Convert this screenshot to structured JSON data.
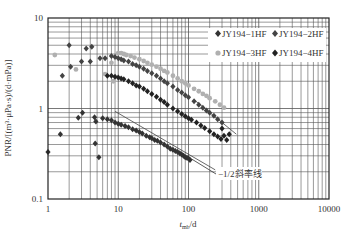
{
  "chart_data": {
    "type": "scatter",
    "title": "",
    "xlabel": "t_mb/d",
    "xlabel_main": "t",
    "xlabel_sub": "mb",
    "xlabel_unit": "/d",
    "ylabel": "PNR/[(m³·μPa·s)/(d·mPa)]",
    "xscale": "log",
    "yscale": "log",
    "xlim": [
      1,
      10000
    ],
    "ylim": [
      0.1,
      10
    ],
    "x_ticks": [
      "1",
      "10",
      "100",
      "1000",
      "10000"
    ],
    "y_ticks": [
      "0.1",
      "1",
      "10"
    ],
    "grid": true,
    "legend_position": "upper right",
    "series": [
      {
        "name": "JY194−1HF",
        "color": "#333333",
        "marker": "diamond",
        "points": [
          [
            1.0,
            0.33
          ],
          [
            1.5,
            0.52
          ],
          [
            2.7,
            0.79
          ],
          [
            3.1,
            0.9
          ],
          [
            4.6,
            0.8
          ],
          [
            4.8,
            0.72
          ],
          [
            4.7,
            0.41
          ],
          [
            5.3,
            0.29
          ],
          [
            6.0,
            0.78
          ],
          [
            7.0,
            0.76
          ],
          [
            8.0,
            0.74
          ],
          [
            9.0,
            0.7
          ],
          [
            10.0,
            0.68
          ],
          [
            11.0,
            0.66
          ],
          [
            12.5,
            0.64
          ],
          [
            14.0,
            0.62
          ],
          [
            16.0,
            0.59
          ],
          [
            18.0,
            0.57
          ],
          [
            20.0,
            0.55
          ],
          [
            22.0,
            0.53
          ],
          [
            25.0,
            0.5
          ],
          [
            28.0,
            0.48
          ],
          [
            30.0,
            0.47
          ],
          [
            33.0,
            0.45
          ],
          [
            36.0,
            0.44
          ],
          [
            40.0,
            0.42
          ],
          [
            45.0,
            0.4
          ],
          [
            50.0,
            0.38
          ],
          [
            55.0,
            0.36
          ],
          [
            60.0,
            0.35
          ],
          [
            65.0,
            0.34
          ],
          [
            70.0,
            0.33
          ],
          [
            75.0,
            0.32
          ],
          [
            80.0,
            0.31
          ],
          [
            85.0,
            0.3
          ],
          [
            90.0,
            0.29
          ],
          [
            95.0,
            0.285
          ],
          [
            100.0,
            0.28
          ],
          [
            105.0,
            0.27
          ]
        ]
      },
      {
        "name": "JY194−2HF",
        "color": "#444444",
        "marker": "diamond",
        "points": [
          [
            1.6,
            2.3
          ],
          [
            2.1,
            2.9
          ],
          [
            2.0,
            5.0
          ],
          [
            3.5,
            4.6
          ],
          [
            4.2,
            4.8
          ],
          [
            3.0,
            3.3
          ],
          [
            4.0,
            3.3
          ],
          [
            5.5,
            3.6
          ],
          [
            6.5,
            3.6
          ],
          [
            8.0,
            3.8
          ],
          [
            9.0,
            3.7
          ],
          [
            10.0,
            3.6
          ],
          [
            11.0,
            3.5
          ],
          [
            12.0,
            3.4
          ],
          [
            14.0,
            3.3
          ],
          [
            16.0,
            3.1
          ],
          [
            18.0,
            3.0
          ],
          [
            20.0,
            2.9
          ],
          [
            23.0,
            2.75
          ],
          [
            26.0,
            2.6
          ],
          [
            30.0,
            2.45
          ],
          [
            35.0,
            2.3
          ],
          [
            40.0,
            2.15
          ],
          [
            45.0,
            2.0
          ],
          [
            50.0,
            1.9
          ],
          [
            60.0,
            1.75
          ],
          [
            70.0,
            1.6
          ],
          [
            80.0,
            1.5
          ],
          [
            90.0,
            1.4
          ],
          [
            100.0,
            1.33
          ],
          [
            120.0,
            1.2
          ],
          [
            140.0,
            1.1
          ],
          [
            160.0,
            1.02
          ],
          [
            180.0,
            0.95
          ],
          [
            200.0,
            0.9
          ],
          [
            230.0,
            0.83
          ],
          [
            260.0,
            0.76
          ],
          [
            300.0,
            0.7
          ]
        ]
      },
      {
        "name": "JY194−3HF",
        "color": "#b0b0b0",
        "marker": "circle",
        "points": [
          [
            1.25,
            3.9
          ],
          [
            2.5,
            2.7
          ],
          [
            6.5,
            2.4
          ],
          [
            8.0,
            3.2
          ],
          [
            8.5,
            2.0
          ],
          [
            10.0,
            4.1
          ],
          [
            11.0,
            4.1
          ],
          [
            12.0,
            4.0
          ],
          [
            13.0,
            3.9
          ],
          [
            15.0,
            3.8
          ],
          [
            17.0,
            3.65
          ],
          [
            20.0,
            3.5
          ],
          [
            23.0,
            3.35
          ],
          [
            26.0,
            3.2
          ],
          [
            30.0,
            3.05
          ],
          [
            35.0,
            2.9
          ],
          [
            40.0,
            2.75
          ],
          [
            45.0,
            2.6
          ],
          [
            50.0,
            2.5
          ],
          [
            60.0,
            2.3
          ],
          [
            70.0,
            2.15
          ],
          [
            80.0,
            2.0
          ],
          [
            90.0,
            1.9
          ],
          [
            100.0,
            1.8
          ],
          [
            120.0,
            1.65
          ],
          [
            140.0,
            1.55
          ],
          [
            160.0,
            1.45
          ],
          [
            180.0,
            1.38
          ],
          [
            200.0,
            1.3
          ],
          [
            240.0,
            1.2
          ],
          [
            280.0,
            1.1
          ],
          [
            320.0,
            1.02
          ]
        ]
      },
      {
        "name": "JY194−4HF",
        "color": "#222222",
        "marker": "diamond",
        "points": [
          [
            7.0,
            2.3
          ],
          [
            8.0,
            2.3
          ],
          [
            9.0,
            2.25
          ],
          [
            10.0,
            2.2
          ],
          [
            11.0,
            2.15
          ],
          [
            12.0,
            2.1
          ],
          [
            14.0,
            2.0
          ],
          [
            16.0,
            1.9
          ],
          [
            18.0,
            1.8
          ],
          [
            20.0,
            1.75
          ],
          [
            23.0,
            1.65
          ],
          [
            26.0,
            1.55
          ],
          [
            30.0,
            1.45
          ],
          [
            35.0,
            1.35
          ],
          [
            40.0,
            1.25
          ],
          [
            45.0,
            1.18
          ],
          [
            50.0,
            1.1
          ],
          [
            60.0,
            1.0
          ],
          [
            70.0,
            0.93
          ],
          [
            80.0,
            0.87
          ],
          [
            90.0,
            0.82
          ],
          [
            100.0,
            0.78
          ],
          [
            110.0,
            0.75
          ],
          [
            130.0,
            0.7
          ],
          [
            150.0,
            0.65
          ],
          [
            170.0,
            0.61
          ],
          [
            200.0,
            0.56
          ],
          [
            230.0,
            0.52
          ],
          [
            260.0,
            0.49
          ],
          [
            290.0,
            0.46
          ],
          [
            320.0,
            0.5
          ],
          [
            350.0,
            0.45
          ],
          [
            380.0,
            0.52
          ],
          [
            300.0,
            0.6
          ]
        ]
      }
    ],
    "reference_lines": [
      {
        "label": "−1/2斜率线",
        "from": [
          9.0,
          0.93
        ],
        "to": [
          240.0,
          0.21
        ]
      },
      {
        "label": "",
        "from": [
          120.0,
          1.25
        ],
        "to": [
          480.0,
          0.52
        ]
      }
    ],
    "annotations": [
      {
        "text": "−1/2斜率线",
        "x": 430,
        "y": 0.2
      }
    ]
  }
}
